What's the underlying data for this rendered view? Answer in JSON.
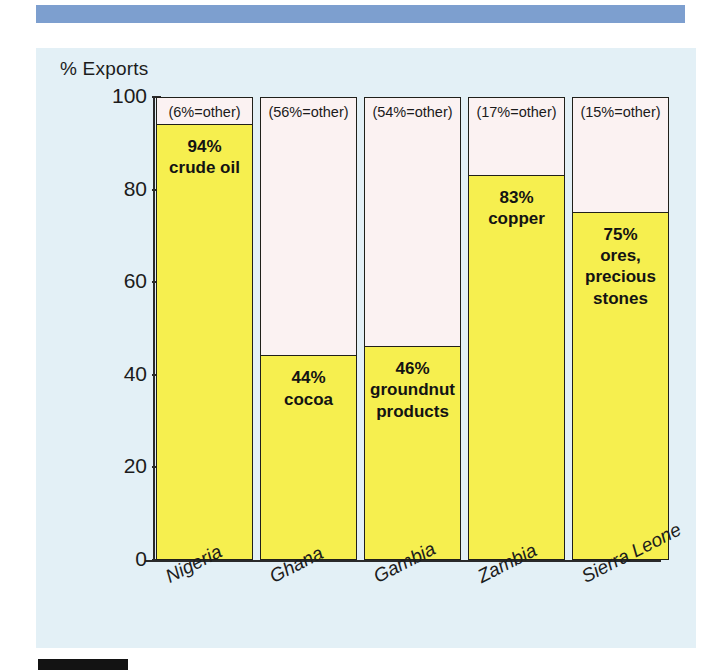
{
  "decor": {
    "top_rule_color": "#7d9fcf",
    "bottom_rule_color": "#131313",
    "panel_bg": "#e3f0f6"
  },
  "chart_data": {
    "type": "bar",
    "title": "",
    "ylabel": "% Exports",
    "xlabel": "",
    "ylim": [
      0,
      100
    ],
    "yticks": [
      0,
      20,
      40,
      60,
      80,
      100
    ],
    "grid": false,
    "legend": "none",
    "colors": {
      "commodity": "#f6ef4f",
      "other": "#fbf2f2",
      "outline": "#20201a"
    },
    "categories": [
      "Nigeria",
      "Ghana",
      "Gambia",
      "Zambia",
      "Sierra Leone"
    ],
    "values": [
      94,
      44,
      46,
      83,
      75
    ],
    "other_values": [
      6,
      56,
      54,
      17,
      15
    ],
    "series": [
      {
        "name": "main commodity",
        "values": [
          94,
          44,
          46,
          83,
          75
        ]
      },
      {
        "name": "other",
        "values": [
          6,
          56,
          54,
          17,
          15
        ]
      }
    ],
    "bars": [
      {
        "category": "Nigeria",
        "value": 94,
        "pct_label": "94%",
        "commodity": "crude oil",
        "other_value": 6,
        "other_label": "(6%=other)"
      },
      {
        "category": "Ghana",
        "value": 44,
        "pct_label": "44%",
        "commodity": "cocoa",
        "other_value": 56,
        "other_label": "(56%=other)"
      },
      {
        "category": "Gambia",
        "value": 46,
        "pct_label": "46%",
        "commodity": "groundnut products",
        "other_value": 54,
        "other_label": "(54%=other)"
      },
      {
        "category": "Zambia",
        "value": 83,
        "pct_label": "83%",
        "commodity": "copper",
        "other_value": 17,
        "other_label": "(17%=other)"
      },
      {
        "category": "Sierra Leone",
        "value": 75,
        "pct_label": "75%",
        "commodity": "ores, precious stones",
        "other_value": 15,
        "other_label": "(15%=other)"
      }
    ],
    "tick_labels": [
      "100",
      "80",
      "60",
      "40",
      "20",
      "0"
    ]
  }
}
